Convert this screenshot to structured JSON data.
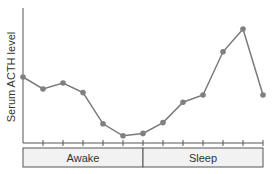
{
  "chart_data": {
    "type": "line",
    "title": "",
    "xlabel": "",
    "ylabel": "Serum ACTH level",
    "x": [
      0,
      1,
      2,
      3,
      4,
      5,
      6,
      7,
      8,
      9,
      10,
      11,
      12
    ],
    "series": [
      {
        "name": "Serum ACTH level",
        "values": [
          55,
          45,
          50,
          42,
          16,
          6,
          8,
          17,
          34,
          40,
          76,
          95,
          40
        ]
      }
    ],
    "ylim": [
      0,
      100
    ],
    "grid": false,
    "bands": [
      {
        "label": "Awake",
        "from": 0,
        "to": 6
      },
      {
        "label": "Sleep",
        "from": 6,
        "to": 12
      }
    ],
    "colors": {
      "line": "#7a7a7a",
      "marker": "#808080",
      "axis": "#555555",
      "band_fill": "#f2f2f2"
    }
  }
}
